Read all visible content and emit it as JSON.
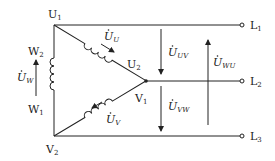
{
  "diagram": {
    "type": "delta-connected three-phase windings",
    "colors": {
      "stroke": "#222222",
      "background": "#ffffff"
    },
    "nodes": {
      "U1": {
        "main": "U",
        "sub": "1"
      },
      "U2": {
        "main": "U",
        "sub": "2"
      },
      "V1": {
        "main": "V",
        "sub": "1"
      },
      "V2": {
        "main": "V",
        "sub": "2"
      },
      "W1": {
        "main": "W",
        "sub": "1"
      },
      "W2": {
        "main": "W",
        "sub": "2"
      }
    },
    "terminals": [
      {
        "main": "L",
        "sub": "1"
      },
      {
        "main": "L",
        "sub": "2"
      },
      {
        "main": "L",
        "sub": "3"
      }
    ],
    "phase_voltages": {
      "U": {
        "main": "U",
        "sub": "U"
      },
      "V": {
        "main": "U",
        "sub": "V"
      },
      "W": {
        "main": "U",
        "sub": "W"
      }
    },
    "line_voltages": {
      "UV": {
        "main": "U",
        "sub": "UV"
      },
      "VW": {
        "main": "U",
        "sub": "VW"
      },
      "WU": {
        "main": "U",
        "sub": "WU"
      }
    }
  }
}
